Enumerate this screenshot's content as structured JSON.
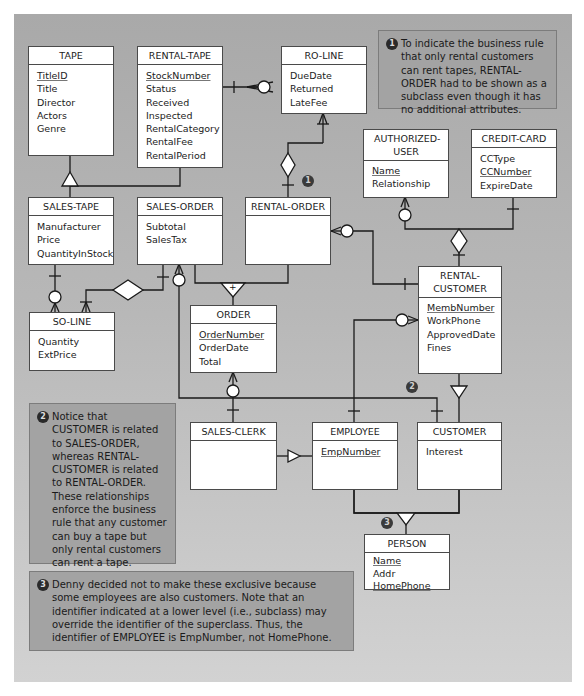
{
  "entities": {
    "tape": {
      "name": "TAPE",
      "attributes": [
        {
          "label": "TitleID",
          "pk": true
        },
        {
          "label": "Title"
        },
        {
          "label": "Director"
        },
        {
          "label": "Actors"
        },
        {
          "label": "Genre"
        }
      ]
    },
    "rental_tape": {
      "name": "RENTAL-TAPE",
      "attributes": [
        {
          "label": "StockNumber",
          "pk": true
        },
        {
          "label": "Status"
        },
        {
          "label": "Received"
        },
        {
          "label": "Inspected"
        },
        {
          "label": "RentalCategory"
        },
        {
          "label": "RentalFee"
        },
        {
          "label": "RentalPeriod"
        }
      ]
    },
    "ro_line": {
      "name": "RO-LINE",
      "attributes": [
        {
          "label": "DueDate"
        },
        {
          "label": "Returned"
        },
        {
          "label": "LateFee"
        }
      ]
    },
    "authorized_user": {
      "name": "AUTHORIZED-USER",
      "attributes": [
        {
          "label": "Name",
          "pk": true
        },
        {
          "label": "Relationship"
        }
      ]
    },
    "credit_card": {
      "name": "CREDIT-CARD",
      "attributes": [
        {
          "label": "CCType"
        },
        {
          "label": "CCNumber",
          "pk": true
        },
        {
          "label": "ExpireDate"
        }
      ]
    },
    "sales_tape": {
      "name": "SALES-TAPE",
      "attributes": [
        {
          "label": "Manufacturer"
        },
        {
          "label": "Price"
        },
        {
          "label": "QuantityInStock"
        }
      ]
    },
    "sales_order": {
      "name": "SALES-ORDER",
      "attributes": [
        {
          "label": "Subtotal"
        },
        {
          "label": "SalesTax"
        }
      ]
    },
    "rental_order": {
      "name": "RENTAL-ORDER",
      "attributes": []
    },
    "rental_customer": {
      "name": "RENTAL-CUSTOMER",
      "attributes": [
        {
          "label": "MembNumber",
          "pk": true
        },
        {
          "label": "WorkPhone"
        },
        {
          "label": "ApprovedDate"
        },
        {
          "label": "Fines"
        }
      ]
    },
    "so_line": {
      "name": "SO-LINE",
      "attributes": [
        {
          "label": "Quantity"
        },
        {
          "label": "ExtPrice"
        }
      ]
    },
    "order": {
      "name": "ORDER",
      "attributes": [
        {
          "label": "OrderNumber",
          "pk": true
        },
        {
          "label": "OrderDate"
        },
        {
          "label": "Total"
        }
      ]
    },
    "sales_clerk": {
      "name": "SALES-CLERK",
      "attributes": []
    },
    "employee": {
      "name": "EMPLOYEE",
      "attributes": [
        {
          "label": "EmpNumber",
          "pk": true
        }
      ]
    },
    "customer": {
      "name": "CUSTOMER",
      "attributes": [
        {
          "label": "Interest"
        }
      ]
    },
    "person": {
      "name": "PERSON",
      "attributes": [
        {
          "label": "Name",
          "pk": true
        },
        {
          "label": "Addr"
        },
        {
          "label": "HomePhone",
          "pk": true
        }
      ]
    }
  },
  "notes": [
    {
      "number": "1",
      "text": "To indicate the business rule that only rental customers can rent tapes, RENTAL-ORDER had to be shown as a subclass even though it has no additional attributes."
    },
    {
      "number": "2",
      "text": "Notice that CUSTOMER is related to SALES-ORDER, whereas RENTAL-CUSTOMER is related to RENTAL-ORDER. These relationships enforce the business rule that any customer can buy a tape but only rental customers can rent a tape."
    },
    {
      "number": "3",
      "text": "Denny decided not to make these exclusive because some employees are also customers. Note that an identifier indicated at a lower level (i.e., subclass) may override the identifier of the superclass. Thus, the identifier of EMPLOYEE is EmpNumber, not HomePhone."
    }
  ],
  "markers": [
    "1",
    "2",
    "3"
  ],
  "symbols": {
    "exclusive_plus": "+"
  },
  "colors": {
    "panel_top": "#a9a9a9",
    "panel_bottom": "#d2d2d2",
    "note_bg": "#a3a3a3",
    "line": "#1a1a1a",
    "entity_bg": "#ffffff"
  }
}
